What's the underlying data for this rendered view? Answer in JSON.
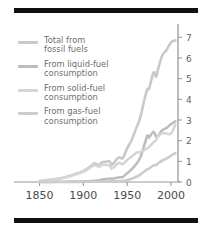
{
  "figure": {
    "background": "#ffffff",
    "rule_color": "#101010",
    "axis_color": "#9a9a9a",
    "tick_text_color": "#5e5e5e"
  },
  "legend": {
    "position": "upper-left",
    "entries": [
      {
        "label": "Total from\nfossil fuels",
        "color": "#c9c9c9",
        "series": "total"
      },
      {
        "label": "From liquid-fuel\nconsumption",
        "color": "#bdbdbd",
        "series": "liquid"
      },
      {
        "label": "From solid-fuel\nconsumption",
        "color": "#d6d6d6",
        "series": "solid"
      },
      {
        "label": "From gas-fuel\nconsumption",
        "color": "#cccccc",
        "series": "gas"
      }
    ]
  },
  "axes": {
    "x": {
      "label": "",
      "ticks": [
        1850,
        1900,
        1950,
        2000
      ],
      "tick_labels": [
        "1850",
        "1900",
        "1950",
        "2000"
      ],
      "range": [
        1830,
        2008
      ]
    },
    "y": {
      "label": "",
      "side": "right",
      "ticks": [
        0,
        1,
        2,
        3,
        4,
        5,
        6,
        7
      ],
      "tick_labels": [
        "0",
        "1",
        "2",
        "3",
        "4",
        "5",
        "6",
        "7"
      ],
      "range": [
        0,
        7.45
      ]
    },
    "grid": false
  },
  "chart_data": {
    "type": "line",
    "title": "",
    "subtitle": "",
    "xlabel": "",
    "ylabel": "",
    "xlim": [
      1830,
      2008
    ],
    "ylim": [
      0,
      7.45
    ],
    "grid": false,
    "legend_position": "upper-left",
    "x": [
      1850,
      1860,
      1870,
      1880,
      1890,
      1900,
      1910,
      1913,
      1918,
      1920,
      1925,
      1930,
      1932,
      1935,
      1940,
      1945,
      1950,
      1955,
      1960,
      1965,
      1970,
      1973,
      1975,
      1980,
      1983,
      1985,
      1990,
      1995,
      2000,
      2005
    ],
    "series": [
      {
        "name": "Total from fossil fuels",
        "color": "#c9c9c9",
        "values": [
          0.05,
          0.09,
          0.15,
          0.24,
          0.38,
          0.53,
          0.82,
          0.9,
          0.81,
          0.93,
          0.98,
          1.0,
          0.83,
          0.93,
          1.18,
          1.16,
          1.63,
          2.02,
          2.57,
          3.13,
          4.05,
          4.5,
          4.52,
          5.29,
          5.1,
          5.42,
          6.12,
          6.39,
          6.76,
          6.85
        ],
        "ylim_note": "units are gigatonnes of carbon per year"
      },
      {
        "name": "From liquid-fuel consumption",
        "color": "#bdbdbd",
        "values": [
          0.0,
          0.0,
          0.01,
          0.01,
          0.02,
          0.03,
          0.05,
          0.06,
          0.08,
          0.1,
          0.14,
          0.17,
          0.15,
          0.17,
          0.22,
          0.25,
          0.42,
          0.61,
          0.85,
          1.18,
          1.84,
          2.24,
          2.16,
          2.43,
          2.2,
          2.23,
          2.5,
          2.62,
          2.8,
          2.94
        ],
        "ylim_note": ""
      },
      {
        "name": "From solid-fuel consumption",
        "color": "#d6d6d6",
        "values": [
          0.05,
          0.09,
          0.14,
          0.22,
          0.35,
          0.49,
          0.75,
          0.83,
          0.72,
          0.81,
          0.82,
          0.8,
          0.65,
          0.72,
          0.92,
          0.87,
          1.07,
          1.22,
          1.41,
          1.45,
          1.56,
          1.63,
          1.7,
          1.92,
          2.03,
          2.2,
          2.36,
          2.34,
          2.34,
          2.78
        ],
        "ylim_note": ""
      },
      {
        "name": "From gas-fuel consumption",
        "color": "#cccccc",
        "values": [
          0.0,
          0.0,
          0.0,
          0.0,
          0.0,
          0.01,
          0.01,
          0.01,
          0.01,
          0.02,
          0.02,
          0.03,
          0.03,
          0.03,
          0.04,
          0.05,
          0.1,
          0.16,
          0.24,
          0.36,
          0.52,
          0.62,
          0.65,
          0.8,
          0.82,
          0.89,
          1.04,
          1.13,
          1.27,
          1.4
        ],
        "ylim_note": ""
      }
    ]
  }
}
